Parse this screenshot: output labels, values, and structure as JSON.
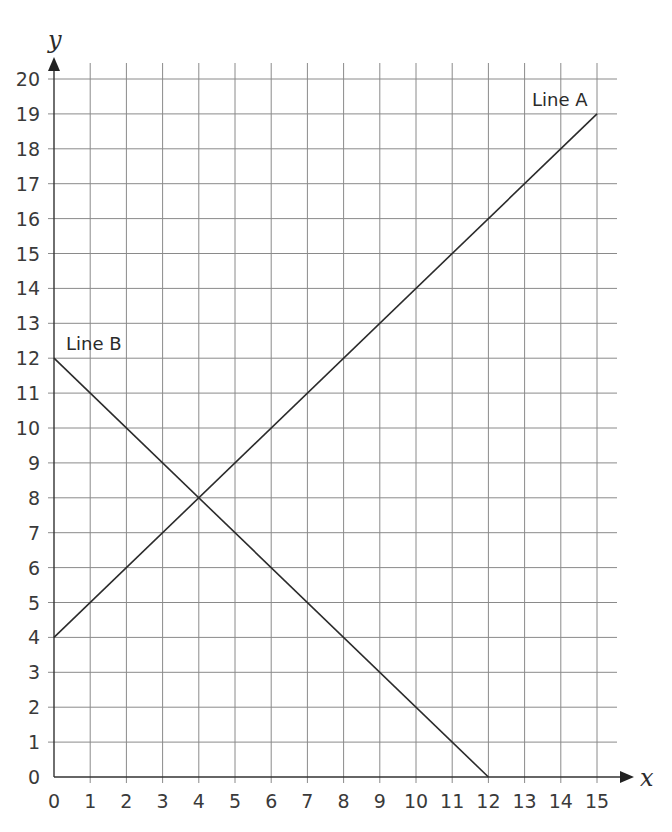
{
  "chart_data": {
    "type": "line",
    "title": "",
    "xlabel": "x",
    "ylabel": "y",
    "xlim": [
      0,
      15
    ],
    "ylim": [
      0,
      20
    ],
    "grid": true,
    "x_ticks": [
      0,
      1,
      2,
      3,
      4,
      5,
      6,
      7,
      8,
      9,
      10,
      11,
      12,
      13,
      14,
      15
    ],
    "y_ticks": [
      0,
      1,
      2,
      3,
      4,
      5,
      6,
      7,
      8,
      9,
      10,
      11,
      12,
      13,
      14,
      15,
      16,
      17,
      18,
      19,
      20
    ],
    "series": [
      {
        "name": "Line A",
        "x": [
          0,
          15
        ],
        "y": [
          4,
          19
        ],
        "equation": "y = x + 4",
        "label_pos": [
          14.5,
          19.6
        ]
      },
      {
        "name": "Line B",
        "x": [
          0,
          12
        ],
        "y": [
          12,
          0
        ],
        "equation": "y = 12 - x",
        "label_pos": [
          0.4,
          12.4
        ]
      }
    ],
    "annotations": [
      {
        "text": "Line A",
        "x": 14.5,
        "y": 19.6
      },
      {
        "text": "Line B",
        "x": 0.4,
        "y": 12.4
      }
    ],
    "intersection": {
      "x": 4,
      "y": 8
    },
    "colors": {
      "line": "#2b2b2b",
      "grid": "#8a8a8a",
      "axis": "#333333"
    }
  },
  "labels": {
    "x_axis": "x",
    "y_axis": "y",
    "line_a": "Line A",
    "line_b": "Line B"
  }
}
